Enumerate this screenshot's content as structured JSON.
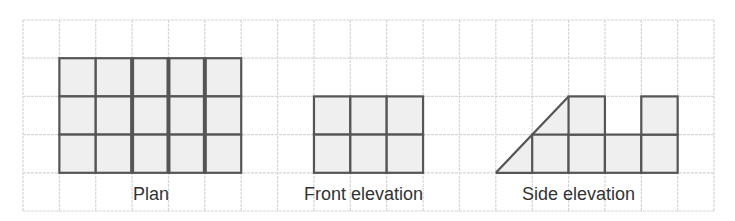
{
  "colors": {
    "grid": "#d6d6d6",
    "fill": "#efefef",
    "outline": "#555555",
    "text": "#333333"
  },
  "grid": {
    "x0": 23,
    "y0": 20,
    "cols": 19,
    "rows": 5,
    "cell_w": 36.37,
    "cell_h": 38.2
  },
  "figures": {
    "plan": {
      "label": "Plan",
      "cols": 5,
      "rows": 3,
      "origin_col": 1,
      "origin_row": 1,
      "thick_lines_cols": [
        3,
        4,
        5
      ]
    },
    "front": {
      "label": "Front elevation",
      "cols": 3,
      "rows": 2,
      "origin_col": 8,
      "origin_row": 2
    },
    "side": {
      "label": "Side elevation",
      "triangle": [
        [
          13,
          4
        ],
        [
          14,
          3
        ],
        [
          15,
          2
        ]
      ],
      "lower_cells": [
        [
          14,
          3
        ],
        [
          15,
          3
        ],
        [
          16,
          3
        ],
        [
          17,
          3
        ]
      ],
      "upper_cells": [
        [
          15,
          2
        ],
        [
          17,
          2
        ]
      ]
    }
  }
}
